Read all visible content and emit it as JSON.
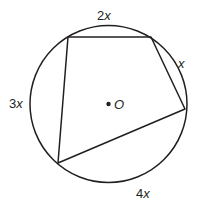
{
  "diagram": {
    "type": "inscribed-quadrilateral",
    "circle": {
      "cx": 108.5,
      "cy": 104,
      "r": 78.5,
      "stroke": "#231f20"
    },
    "center": {
      "x": 108.5,
      "y": 104,
      "label": "O"
    },
    "vertices": [
      {
        "x": 68,
        "y": 37
      },
      {
        "x": 151,
        "y": 37
      },
      {
        "x": 185,
        "y": 109
      },
      {
        "x": 58,
        "y": 163
      }
    ],
    "arcs": [
      {
        "label_coef": "2",
        "label_var": "x",
        "x": 97,
        "y": 20
      },
      {
        "label_coef": "",
        "label_var": "x",
        "x": 178,
        "y": 68
      },
      {
        "label_coef": "4",
        "label_var": "x",
        "x": 136,
        "y": 198
      },
      {
        "label_coef": "3",
        "label_var": "x",
        "x": 9,
        "y": 108
      }
    ]
  }
}
